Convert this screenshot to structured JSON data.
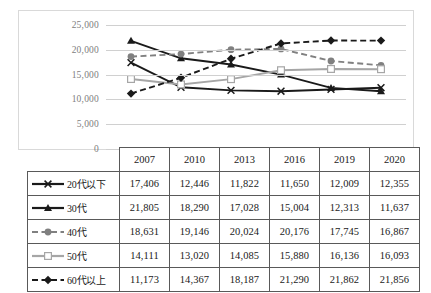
{
  "chart_data": {
    "type": "line",
    "title": "",
    "xlabel": "",
    "ylabel": "",
    "categories": [
      "2007",
      "2010",
      "2013",
      "2016",
      "2019",
      "2020"
    ],
    "ylim": [
      0,
      25000
    ],
    "ytick_step": 5000,
    "yticks": [
      "0",
      "5,000",
      "10,000",
      "15,000",
      "20,000",
      "25,000"
    ],
    "grid": true,
    "legend_position": "table-row-labels",
    "series": [
      {
        "name": "20代以下",
        "values": [
          17406,
          12446,
          11822,
          11650,
          12009,
          12355
        ],
        "labels": [
          "17,406",
          "12,446",
          "11,822",
          "11,650",
          "12,009",
          "12,355"
        ],
        "color": "#1a1a1a",
        "marker": "x",
        "dash": "solid"
      },
      {
        "name": "30代",
        "values": [
          21805,
          18290,
          17028,
          15004,
          12313,
          11637
        ],
        "labels": [
          "21,805",
          "18,290",
          "17,028",
          "15,004",
          "12,313",
          "11,637"
        ],
        "color": "#1a1a1a",
        "marker": "triangle",
        "dash": "solid"
      },
      {
        "name": "40代",
        "values": [
          18631,
          19146,
          20024,
          20176,
          17745,
          16867
        ],
        "labels": [
          "18,631",
          "19,146",
          "20,024",
          "20,176",
          "17,745",
          "16,867"
        ],
        "color": "#808080",
        "marker": "circle",
        "dash": "dashed"
      },
      {
        "name": "50代",
        "values": [
          14111,
          13020,
          14085,
          15880,
          16136,
          16093
        ],
        "labels": [
          "14,111",
          "13,020",
          "14,085",
          "15,880",
          "16,136",
          "16,093"
        ],
        "color": "#a6a6a6",
        "marker": "square-open",
        "dash": "solid"
      },
      {
        "name": "60代以上",
        "values": [
          11173,
          14367,
          18187,
          21290,
          21862,
          21856
        ],
        "labels": [
          "11,173",
          "14,367",
          "18,187",
          "21,290",
          "21,862",
          "21,856"
        ],
        "color": "#1a1a1a",
        "marker": "diamond",
        "dash": "dashed"
      }
    ]
  },
  "table": {
    "corner_label": "",
    "column_headers": [
      "2007",
      "2010",
      "2013",
      "2016",
      "2019",
      "2020"
    ],
    "rows": [
      {
        "label": "20代以下",
        "values": [
          "17,406",
          "12,446",
          "11,822",
          "11,650",
          "12,009",
          "12,355"
        ]
      },
      {
        "label": "30代",
        "values": [
          "21,805",
          "18,290",
          "17,028",
          "15,004",
          "12,313",
          "11,637"
        ]
      },
      {
        "label": "40代",
        "values": [
          "18,631",
          "19,146",
          "20,024",
          "20,176",
          "17,745",
          "16,867"
        ]
      },
      {
        "label": "50代",
        "values": [
          "14,111",
          "13,020",
          "14,085",
          "15,880",
          "16,136",
          "16,093"
        ]
      },
      {
        "label": "60代以上",
        "values": [
          "11,173",
          "14,367",
          "18,187",
          "21,290",
          "21,862",
          "21,856"
        ]
      }
    ]
  },
  "colors": {
    "black_series": "#1a1a1a",
    "gray_series": "#808080",
    "light_gray_series": "#a6a6a6",
    "gridline": "#d0d0d0",
    "chart_border": "#d9d9d9",
    "table_border": "#595959",
    "axis_text": "#808080"
  }
}
